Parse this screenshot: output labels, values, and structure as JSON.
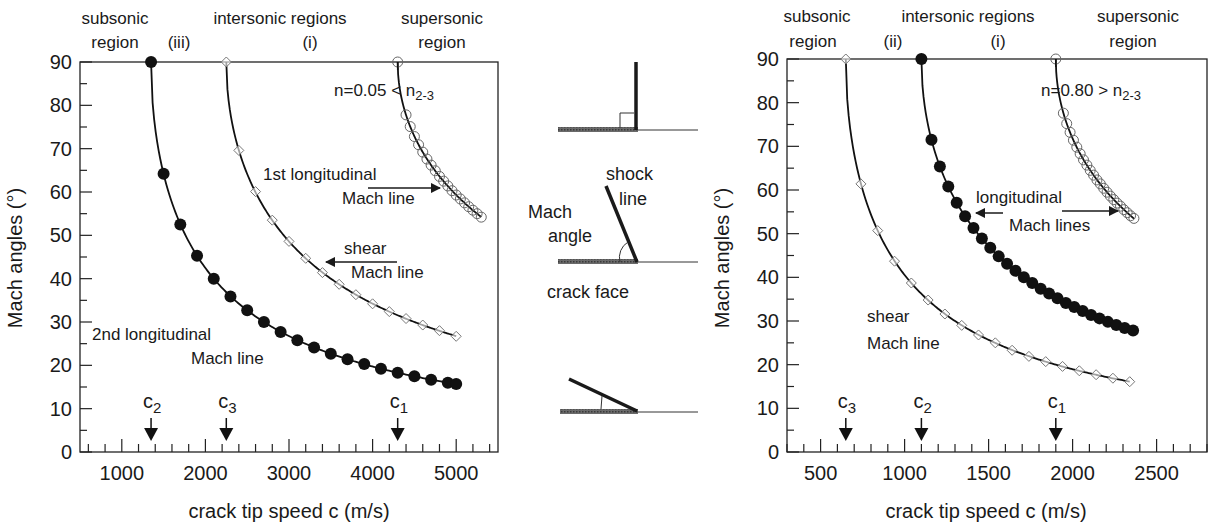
{
  "chart_data": [
    {
      "type": "scatter",
      "panel": "left",
      "title": "",
      "xlabel": "crack tip speed c (m/s)",
      "ylabel": "Mach angles (°)",
      "xlim": [
        500,
        5500
      ],
      "ylim": [
        0,
        90
      ],
      "xticks": [
        1000,
        2000,
        3000,
        4000,
        5000
      ],
      "yticks": [
        0,
        10,
        20,
        30,
        40,
        50,
        60,
        70,
        80,
        90
      ],
      "grid": false,
      "annotation_n": "n=0.05 < n",
      "annotation_n_sub": "2-3",
      "region_labels": [
        {
          "line1": "subsonic",
          "line2": "region"
        },
        {
          "line1": "",
          "line2": "(iii)"
        },
        {
          "line1": "intersonic regions",
          "line2": "(i)"
        },
        {
          "line1": "supersonic",
          "line2": "region"
        }
      ],
      "wave_speeds": [
        {
          "name": "c",
          "sub": "2",
          "value": 1350
        },
        {
          "name": "c",
          "sub": "3",
          "value": 2250
        },
        {
          "name": "c",
          "sub": "1",
          "value": 4300
        }
      ],
      "series": [
        {
          "name": "2nd longitudinal Mach line",
          "marker": "filled-circle",
          "wave_speed": 1350,
          "x": [
            1350,
            1500,
            1700,
            1900,
            2100,
            2300,
            2500,
            2700,
            2900,
            3100,
            3300,
            3500,
            3700,
            3900,
            4100,
            4300,
            4500,
            4700,
            4900,
            5000
          ],
          "y": [
            90,
            64.2,
            52.5,
            45.3,
            40.0,
            35.9,
            32.7,
            30.0,
            27.7,
            25.8,
            24.1,
            22.7,
            21.4,
            20.3,
            19.2,
            18.3,
            17.5,
            16.7,
            16.0,
            15.7
          ]
        },
        {
          "name": "shear Mach line",
          "marker": "open-diamond",
          "wave_speed": 2250,
          "x": [
            2250,
            2400,
            2600,
            2800,
            3000,
            3200,
            3400,
            3600,
            3800,
            4000,
            4200,
            4400,
            4600,
            4800,
            5000
          ],
          "y": [
            90,
            69.6,
            60.1,
            53.5,
            48.6,
            44.7,
            41.4,
            38.7,
            36.3,
            34.2,
            32.4,
            30.8,
            29.3,
            28.0,
            26.7
          ]
        },
        {
          "name": "1st longitudinal Mach line",
          "marker": "open-circle",
          "wave_speed": 4300,
          "x": [
            4300,
            4400,
            4450,
            4500,
            4550,
            4600,
            4650,
            4700,
            4750,
            4800,
            4850,
            4900,
            4950,
            5000,
            5050,
            5100,
            5150,
            5200,
            5250,
            5300
          ],
          "y": [
            90,
            77.8,
            75.1,
            72.8,
            70.9,
            69.2,
            67.6,
            66.2,
            64.9,
            63.6,
            62.5,
            61.4,
            60.3,
            59.3,
            58.4,
            57.5,
            56.6,
            55.8,
            55.0,
            54.2
          ]
        }
      ],
      "curve_labels": [
        {
          "text": "1st longitudinal",
          "text2": "Mach line"
        },
        {
          "text": "shear",
          "text2": "Mach line"
        },
        {
          "text": "2nd longitudinal",
          "text2": "Mach line"
        }
      ]
    },
    {
      "type": "scatter",
      "panel": "right",
      "title": "",
      "xlabel": "crack tip speed c (m/s)",
      "ylabel": "Mach angles (°)",
      "xlim": [
        300,
        2800
      ],
      "ylim": [
        0,
        90
      ],
      "xticks": [
        500,
        1000,
        1500,
        2000,
        2500
      ],
      "yticks": [
        0,
        10,
        20,
        30,
        40,
        50,
        60,
        70,
        80,
        90
      ],
      "grid": false,
      "annotation_n": "n=0.80 > n",
      "annotation_n_sub": "2-3",
      "region_labels": [
        {
          "line1": "subsonic",
          "line2": "region"
        },
        {
          "line1": "",
          "line2": "(ii)"
        },
        {
          "line1": "intersonic regions",
          "line2": "(i)"
        },
        {
          "line1": "supersonic",
          "line2": "region"
        }
      ],
      "wave_speeds": [
        {
          "name": "c",
          "sub": "3",
          "value": 650
        },
        {
          "name": "c",
          "sub": "2",
          "value": 1100
        },
        {
          "name": "c",
          "sub": "1",
          "value": 1900
        }
      ],
      "series": [
        {
          "name": "shear Mach line",
          "marker": "open-diamond",
          "wave_speed": 650,
          "x": [
            650,
            740,
            840,
            940,
            1040,
            1140,
            1240,
            1340,
            1440,
            1540,
            1640,
            1740,
            1840,
            1940,
            2040,
            2140,
            2240,
            2340
          ],
          "y": [
            90,
            61.4,
            50.7,
            43.7,
            38.7,
            34.8,
            31.6,
            29.0,
            26.8,
            25.0,
            23.3,
            21.9,
            20.7,
            19.6,
            18.6,
            17.7,
            16.9,
            16.1
          ]
        },
        {
          "name": "2nd longitudinal Mach line",
          "marker": "filled-circle",
          "wave_speed": 1100,
          "x": [
            1100,
            1160,
            1210,
            1260,
            1310,
            1360,
            1410,
            1460,
            1510,
            1560,
            1610,
            1660,
            1710,
            1760,
            1810,
            1860,
            1910,
            1960,
            2010,
            2060,
            2110,
            2160,
            2210,
            2260,
            2310,
            2360
          ],
          "y": [
            90,
            71.5,
            65.4,
            60.8,
            57.1,
            54.0,
            51.3,
            48.9,
            46.8,
            44.8,
            43.1,
            41.5,
            40.0,
            38.7,
            37.4,
            36.3,
            35.2,
            34.1,
            33.2,
            32.3,
            31.4,
            30.6,
            29.8,
            29.1,
            28.4,
            27.8
          ]
        },
        {
          "name": "1st longitudinal Mach line",
          "marker": "open-circle",
          "wave_speed": 1900,
          "x": [
            1900,
            1945,
            1965,
            1985,
            2005,
            2025,
            2045,
            2065,
            2085,
            2105,
            2125,
            2145,
            2165,
            2185,
            2205,
            2225,
            2245,
            2265,
            2285,
            2305,
            2325,
            2345,
            2365
          ],
          "y": [
            90,
            77.6,
            75.2,
            73.2,
            71.4,
            69.8,
            68.3,
            66.9,
            65.7,
            64.5,
            63.4,
            62.3,
            61.4,
            60.4,
            59.5,
            58.6,
            57.8,
            57.0,
            56.3,
            55.5,
            54.8,
            54.1,
            53.5
          ]
        }
      ],
      "curve_labels": [
        {
          "text": "longitudinal",
          "text2": "Mach lines"
        },
        {
          "text": "shear",
          "text2": "Mach line"
        }
      ]
    }
  ],
  "schematics": {
    "shock_line_label_1": "shock",
    "shock_line_label_2": "line",
    "mach_angle_label_1": "Mach",
    "mach_angle_label_2": "angle",
    "crack_face_label": "crack face"
  }
}
